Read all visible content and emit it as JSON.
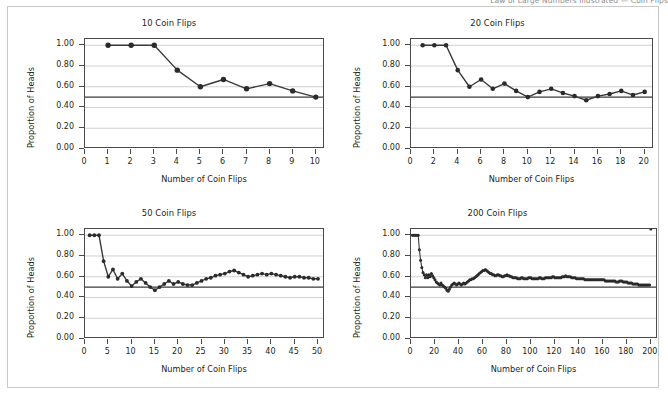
{
  "page": {
    "background_color": "#ffffff",
    "frame_color": "#c9c9c9",
    "clipped_header_text": "Law of Large Numbers Illustrated — Coin Flips"
  },
  "style": {
    "line_color": "#3a3a3a",
    "marker_color": "#2b2b2b",
    "grid_color": "#d0d0d0",
    "axis_color": "#4a4a4a",
    "reference_line_color": "#3a3a3a",
    "text_color": "#231f20"
  },
  "common": {
    "xlabel": "Number of Coin Flips",
    "ylabel": "Proportion of Heads",
    "yticks": [
      "0.00",
      "0.20",
      "0.40",
      "0.60",
      "0.80",
      "1.00"
    ],
    "ylim": [
      0,
      1.06
    ],
    "reference_value": 0.5,
    "grid": "horizontal"
  },
  "chart_data": [
    {
      "type": "line",
      "title": "10 Coin Flips",
      "xlabel": "Number of Coin Flips",
      "ylabel": "Proportion of Heads",
      "xlim": [
        0,
        10.4
      ],
      "ylim": [
        0,
        1.06
      ],
      "xticks": [
        0,
        1,
        2,
        3,
        4,
        5,
        6,
        7,
        8,
        9,
        10
      ],
      "xtick_labels": [
        "0",
        "1",
        "2",
        "3",
        "4",
        "5",
        "6",
        "7",
        "8",
        "9",
        "10"
      ],
      "yticks": [
        0.0,
        0.2,
        0.4,
        0.6,
        0.8,
        1.0
      ],
      "ytick_labels": [
        "0.00",
        "0.20",
        "0.40",
        "0.60",
        "0.80",
        "1.00"
      ],
      "markers": true,
      "reference_line": 0.5,
      "x": [
        1,
        2,
        3,
        4,
        5,
        6,
        7,
        8,
        9,
        10
      ],
      "values": [
        1.0,
        1.0,
        1.0,
        0.76,
        0.6,
        0.67,
        0.58,
        0.63,
        0.56,
        0.5
      ]
    },
    {
      "type": "line",
      "title": "20 Coin Flips",
      "xlabel": "Number of Coin Flips",
      "ylabel": "Proportion of Heads",
      "xlim": [
        0,
        20.8
      ],
      "ylim": [
        0,
        1.06
      ],
      "xticks": [
        0,
        2,
        4,
        6,
        8,
        10,
        12,
        14,
        16,
        18,
        20
      ],
      "xtick_labels": [
        "0",
        "2",
        "4",
        "6",
        "8",
        "10",
        "12",
        "14",
        "16",
        "18",
        "20"
      ],
      "yticks": [
        0.0,
        0.2,
        0.4,
        0.6,
        0.8,
        1.0
      ],
      "ytick_labels": [
        "0.00",
        "0.20",
        "0.40",
        "0.60",
        "0.80",
        "1.00"
      ],
      "markers": true,
      "reference_line": 0.5,
      "x": [
        1,
        2,
        3,
        4,
        5,
        6,
        7,
        8,
        9,
        10,
        11,
        12,
        13,
        14,
        15,
        16,
        17,
        18,
        19,
        20
      ],
      "values": [
        1.0,
        1.0,
        1.0,
        0.76,
        0.6,
        0.67,
        0.58,
        0.63,
        0.56,
        0.5,
        0.55,
        0.58,
        0.54,
        0.51,
        0.47,
        0.51,
        0.53,
        0.56,
        0.52,
        0.55
      ]
    },
    {
      "type": "line",
      "title": "50 Coin Flips",
      "xlabel": "Number of Coin Flips",
      "ylabel": "Proportion of Heads",
      "xlim": [
        0,
        51.5
      ],
      "ylim": [
        0,
        1.06
      ],
      "xticks": [
        0,
        5,
        10,
        15,
        20,
        25,
        30,
        35,
        40,
        45,
        50
      ],
      "xtick_labels": [
        "0",
        "5",
        "10",
        "15",
        "20",
        "25",
        "30",
        "35",
        "40",
        "45",
        "50"
      ],
      "yticks": [
        0.0,
        0.2,
        0.4,
        0.6,
        0.8,
        1.0
      ],
      "ytick_labels": [
        "0.00",
        "0.20",
        "0.40",
        "0.60",
        "0.80",
        "1.00"
      ],
      "markers": true,
      "reference_line": 0.5,
      "x": [
        1,
        2,
        3,
        4,
        5,
        6,
        7,
        8,
        9,
        10,
        11,
        12,
        13,
        14,
        15,
        16,
        17,
        18,
        19,
        20,
        21,
        22,
        23,
        24,
        25,
        26,
        27,
        28,
        29,
        30,
        31,
        32,
        33,
        34,
        35,
        36,
        37,
        38,
        39,
        40,
        41,
        42,
        43,
        44,
        45,
        46,
        47,
        48,
        49,
        50
      ],
      "values": [
        1.0,
        1.0,
        1.0,
        0.75,
        0.6,
        0.67,
        0.58,
        0.63,
        0.56,
        0.51,
        0.55,
        0.58,
        0.54,
        0.5,
        0.47,
        0.5,
        0.53,
        0.56,
        0.53,
        0.55,
        0.53,
        0.52,
        0.52,
        0.54,
        0.56,
        0.58,
        0.59,
        0.61,
        0.62,
        0.63,
        0.65,
        0.66,
        0.64,
        0.62,
        0.6,
        0.61,
        0.62,
        0.63,
        0.62,
        0.63,
        0.62,
        0.61,
        0.6,
        0.59,
        0.6,
        0.6,
        0.59,
        0.59,
        0.58,
        0.58
      ]
    },
    {
      "type": "line",
      "title": "200 Coin Flips",
      "xlabel": "Number of Coin Flips",
      "ylabel": "Proportion of Heads",
      "xlim": [
        0,
        206
      ],
      "ylim": [
        0,
        1.06
      ],
      "xticks": [
        0,
        20,
        40,
        60,
        80,
        100,
        120,
        140,
        160,
        180,
        200
      ],
      "xtick_labels": [
        "0",
        "20",
        "40",
        "60",
        "80",
        "100",
        "120",
        "140",
        "160",
        "180",
        "200"
      ],
      "yticks": [
        0.0,
        0.2,
        0.4,
        0.6,
        0.8,
        1.0
      ],
      "ytick_labels": [
        "0.00",
        "0.20",
        "0.40",
        "0.60",
        "0.80",
        "1.00"
      ],
      "markers": true,
      "reference_line": 0.5,
      "x": [
        1,
        2,
        3,
        4,
        5,
        6,
        7,
        8,
        9,
        10,
        11,
        12,
        13,
        14,
        15,
        16,
        17,
        18,
        19,
        20,
        21,
        22,
        23,
        24,
        25,
        26,
        27,
        28,
        29,
        30,
        31,
        32,
        33,
        34,
        35,
        36,
        37,
        38,
        39,
        40,
        41,
        42,
        43,
        44,
        45,
        46,
        47,
        48,
        49,
        50,
        51,
        52,
        53,
        54,
        55,
        56,
        57,
        58,
        59,
        60,
        61,
        62,
        63,
        64,
        65,
        66,
        67,
        68,
        69,
        70,
        71,
        72,
        73,
        74,
        75,
        76,
        77,
        78,
        79,
        80,
        81,
        82,
        83,
        84,
        85,
        86,
        87,
        88,
        89,
        90,
        91,
        92,
        93,
        94,
        95,
        96,
        97,
        98,
        99,
        100,
        101,
        102,
        103,
        104,
        105,
        106,
        107,
        108,
        109,
        110,
        111,
        112,
        113,
        114,
        115,
        116,
        117,
        118,
        119,
        120,
        121,
        122,
        123,
        124,
        125,
        126,
        127,
        128,
        129,
        130,
        131,
        132,
        133,
        134,
        135,
        136,
        137,
        138,
        139,
        140,
        141,
        142,
        143,
        144,
        145,
        146,
        147,
        148,
        149,
        150,
        151,
        152,
        153,
        154,
        155,
        156,
        157,
        158,
        159,
        160,
        161,
        162,
        163,
        164,
        165,
        166,
        167,
        168,
        169,
        170,
        171,
        172,
        173,
        174,
        175,
        176,
        177,
        178,
        179,
        180,
        181,
        182,
        183,
        184,
        185,
        186,
        187,
        188,
        189,
        190,
        191,
        192,
        193,
        194,
        195,
        196,
        197,
        198,
        199,
        200
      ],
      "values": [
        1.0,
        1.0,
        1.0,
        1.0,
        1.0,
        1.0,
        0.86,
        0.76,
        0.69,
        0.64,
        0.62,
        0.59,
        0.62,
        0.59,
        0.62,
        0.6,
        0.63,
        0.61,
        0.59,
        0.57,
        0.55,
        0.54,
        0.53,
        0.52,
        0.54,
        0.52,
        0.51,
        0.5,
        0.49,
        0.47,
        0.46,
        0.48,
        0.5,
        0.52,
        0.53,
        0.54,
        0.53,
        0.52,
        0.53,
        0.54,
        0.53,
        0.52,
        0.53,
        0.54,
        0.53,
        0.54,
        0.55,
        0.56,
        0.57,
        0.57,
        0.58,
        0.58,
        0.59,
        0.6,
        0.61,
        0.62,
        0.63,
        0.64,
        0.65,
        0.66,
        0.66,
        0.67,
        0.66,
        0.65,
        0.64,
        0.63,
        0.63,
        0.62,
        0.62,
        0.61,
        0.61,
        0.62,
        0.62,
        0.61,
        0.61,
        0.6,
        0.6,
        0.61,
        0.61,
        0.62,
        0.61,
        0.61,
        0.6,
        0.6,
        0.59,
        0.59,
        0.59,
        0.59,
        0.58,
        0.58,
        0.58,
        0.59,
        0.59,
        0.58,
        0.58,
        0.58,
        0.58,
        0.59,
        0.59,
        0.59,
        0.58,
        0.58,
        0.58,
        0.58,
        0.58,
        0.58,
        0.59,
        0.59,
        0.58,
        0.58,
        0.58,
        0.59,
        0.59,
        0.59,
        0.59,
        0.59,
        0.59,
        0.6,
        0.6,
        0.59,
        0.59,
        0.59,
        0.59,
        0.59,
        0.59,
        0.6,
        0.6,
        0.6,
        0.61,
        0.6,
        0.6,
        0.6,
        0.6,
        0.59,
        0.59,
        0.59,
        0.59,
        0.58,
        0.58,
        0.58,
        0.58,
        0.58,
        0.58,
        0.58,
        0.57,
        0.57,
        0.57,
        0.57,
        0.57,
        0.57,
        0.57,
        0.57,
        0.57,
        0.57,
        0.57,
        0.57,
        0.57,
        0.57,
        0.57,
        0.57,
        0.57,
        0.56,
        0.56,
        0.56,
        0.56,
        0.56,
        0.56,
        0.56,
        0.56,
        0.56,
        0.55,
        0.55,
        0.55,
        0.56,
        0.56,
        0.56,
        0.55,
        0.55,
        0.55,
        0.55,
        0.54,
        0.54,
        0.54,
        0.54,
        0.53,
        0.53,
        0.53,
        0.53,
        0.53,
        0.52,
        0.52,
        0.52,
        0.52,
        0.52,
        0.52,
        0.52,
        0.52,
        0.52,
        0.52
      ]
    }
  ]
}
